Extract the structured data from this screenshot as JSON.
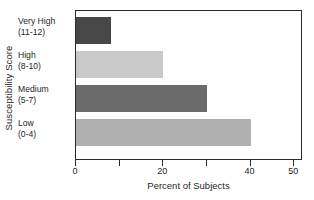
{
  "chart_data": {
    "type": "bar",
    "orientation": "horizontal",
    "title": "",
    "xlabel": "Percent of Subjects",
    "ylabel": "Susceptibility Score",
    "categories": [
      "Very High",
      "High",
      "Medium",
      "Low"
    ],
    "category_ranges": [
      "(11-12)",
      "(8-10)",
      "(5-7)",
      "(0-4)"
    ],
    "category_labels": [
      "Very High (11-12)",
      "High (8-10)",
      "Medium (5-7)",
      "Low (0-4)"
    ],
    "values": [
      8,
      20,
      30,
      40
    ],
    "bar_colors": [
      "#474747",
      "#c9c9c9",
      "#6b6b6b",
      "#b0b0b0"
    ],
    "xlim": [
      0,
      52
    ],
    "xticks": [
      0,
      10,
      20,
      30,
      40,
      50
    ],
    "xtick_labels": [
      "0",
      "",
      "20",
      "",
      "40",
      "50"
    ],
    "grid": false,
    "legend": false,
    "axis_color": "#2b2b2b",
    "background": "#ffffff"
  }
}
